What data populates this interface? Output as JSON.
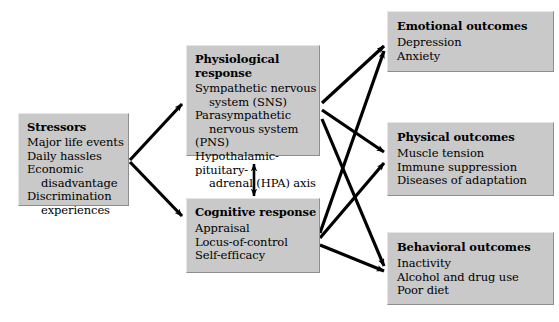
{
  "diagram": {
    "box_fill": "#c9c9c9",
    "arrow_color": "#000000",
    "nodes": [
      {
        "id": "stressors",
        "title": "Stressors",
        "items": [
          "Major life events",
          "Daily hassles",
          "Economic",
          "disadvantage",
          "Discrimination",
          "experiences"
        ]
      },
      {
        "id": "physiological",
        "title": "Physiological response",
        "items": [
          "Sympathetic nervous",
          "system (SNS)",
          "Parasympathetic",
          "nervous system (PNS)",
          "Hypothalamic-pituitary-",
          "adrenal (HPA) axis"
        ]
      },
      {
        "id": "cognitive",
        "title": "Cognitive response",
        "items": [
          "Appraisal",
          "Locus-of-control",
          "Self-efficacy"
        ]
      },
      {
        "id": "emotional",
        "title": "Emotional outcomes",
        "items": [
          "Depression",
          "Anxiety"
        ]
      },
      {
        "id": "physical",
        "title": "Physical outcomes",
        "items": [
          "Muscle tension",
          "Immune suppression",
          "Diseases of adaptation"
        ]
      },
      {
        "id": "behavioral",
        "title": "Behavioral outcomes",
        "items": [
          "Inactivity",
          "Alcohol and drug use",
          "Poor diet"
        ]
      }
    ],
    "edges": [
      {
        "from": "stressors",
        "to": "physiological",
        "style": "single-arrow"
      },
      {
        "from": "stressors",
        "to": "cognitive",
        "style": "single-arrow"
      },
      {
        "from": "physiological",
        "to": "cognitive",
        "style": "double-arrow"
      },
      {
        "from": "physiological",
        "to": "emotional",
        "style": "single-arrow"
      },
      {
        "from": "physiological",
        "to": "physical",
        "style": "single-arrow"
      },
      {
        "from": "physiological",
        "to": "behavioral",
        "style": "single-arrow"
      },
      {
        "from": "cognitive",
        "to": "emotional",
        "style": "single-arrow"
      },
      {
        "from": "cognitive",
        "to": "physical",
        "style": "single-arrow"
      },
      {
        "from": "cognitive",
        "to": "behavioral",
        "style": "single-arrow"
      }
    ]
  }
}
